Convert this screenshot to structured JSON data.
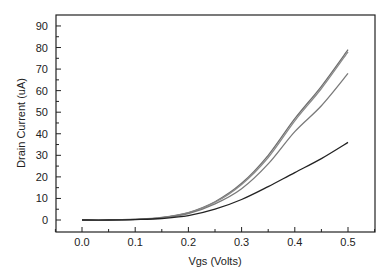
{
  "chart_data": {
    "type": "line",
    "title": "",
    "xlabel": "Vgs (Volts)",
    "ylabel": "Drain Current (uA)",
    "xlim": [
      -0.05,
      0.55
    ],
    "ylim": [
      -5,
      95
    ],
    "xticks": [
      "0.0",
      "0.1",
      "0.2",
      "0.3",
      "0.4",
      "0.5"
    ],
    "yticks": [
      "0",
      "10",
      "20",
      "30",
      "40",
      "50",
      "60",
      "70",
      "80",
      "90"
    ],
    "grid": false,
    "legend": null,
    "x": [
      0.0,
      0.05,
      0.1,
      0.15,
      0.2,
      0.25,
      0.3,
      0.35,
      0.4,
      0.45,
      0.5
    ],
    "series": [
      {
        "name": "curve-1",
        "color": "#6e6e6e",
        "values": [
          0,
          0,
          0.3,
          1.2,
          3.5,
          8.5,
          17,
          30,
          47,
          62,
          79
        ]
      },
      {
        "name": "curve-2",
        "color": "#8a8a8a",
        "values": [
          0,
          0,
          0.3,
          1.1,
          3.3,
          8.2,
          16.5,
          29,
          46,
          61,
          78
        ]
      },
      {
        "name": "curve-3",
        "color": "#7a7a7a",
        "values": [
          0,
          0,
          0.3,
          1.0,
          3.0,
          7.5,
          14.5,
          26,
          41,
          53,
          68
        ]
      },
      {
        "name": "curve-4",
        "color": "#222222",
        "values": [
          0,
          0,
          0.2,
          0.7,
          2.0,
          5.0,
          9.5,
          15.5,
          22,
          28.5,
          36
        ]
      }
    ]
  }
}
